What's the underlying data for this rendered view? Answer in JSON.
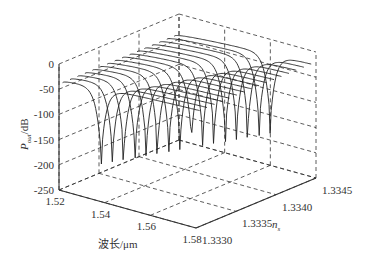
{
  "chart_data": {
    "type": "3d-line",
    "title": "",
    "xlabel": "波长/μm",
    "ylabel": "n_s",
    "zlabel": "P_out/dB",
    "zlabel_main": "P",
    "zlabel_sub": "out",
    "zlabel_suffix": "/dB",
    "ylabel_main": "n",
    "ylabel_sub": "s",
    "xlim": [
      1.52,
      1.58
    ],
    "ylim": [
      1.333,
      1.3345
    ],
    "zlim": [
      -250,
      0
    ],
    "x_ticks": [
      "1.52",
      "1.54",
      "1.56",
      "1.58"
    ],
    "y_ticks": [
      "1.3330",
      "1.3335",
      "1.3340",
      "1.3345"
    ],
    "z_ticks": [
      "0",
      "-50",
      "-100",
      "-150",
      "-200",
      "-250"
    ],
    "grid": true,
    "series_description": "Family of transmission curves, one per refractive index n_s from 1.3330 to 1.3345; each curve descends from about -40 dB at 1.52 μm into a sharp resonance dip (down to about -180 dB) whose wavelength shifts with n_s, then recovers to about -20 dB toward 1.58 μm",
    "series_count": 16,
    "baseline_start_db": -40,
    "baseline_end_db": -20,
    "dip_min_db": -180
  }
}
